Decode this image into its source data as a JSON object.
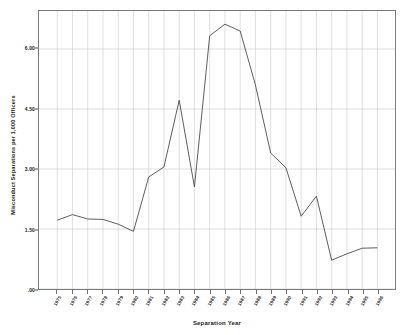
{
  "chart_data": {
    "type": "line",
    "title": "",
    "xlabel": "Separation Year",
    "ylabel": "Misconduct Separations per 1,000 Officers",
    "categories": [
      "1975",
      "1976",
      "1977",
      "1978",
      "1979",
      "1980",
      "1981",
      "1982",
      "1983",
      "1984",
      "1985",
      "1986",
      "1987",
      "1988",
      "1989",
      "1990",
      "1991",
      "1992",
      "1993",
      "1994",
      "1995",
      "1996"
    ],
    "values": [
      1.72,
      1.86,
      1.75,
      1.74,
      1.62,
      1.44,
      2.8,
      3.05,
      4.72,
      2.55,
      6.33,
      6.62,
      6.45,
      5.1,
      3.4,
      3.03,
      1.82,
      2.32,
      0.72,
      0.88,
      1.02,
      1.03
    ],
    "series": [
      {
        "name": "Misconduct Separations per 1,000 Officers",
        "values": [
          1.72,
          1.86,
          1.75,
          1.74,
          1.62,
          1.44,
          2.8,
          3.05,
          4.72,
          2.55,
          6.33,
          6.62,
          6.45,
          5.1,
          3.4,
          3.03,
          1.82,
          2.32,
          0.72,
          0.88,
          1.02,
          1.03
        ]
      }
    ],
    "ylim": [
      0.0,
      6.95
    ],
    "yticks": [
      0.0,
      1.5,
      3.0,
      4.5,
      6.0
    ],
    "ytick_labels": [
      ".00",
      "1.50",
      "3.00",
      "4.50",
      "6.00"
    ],
    "grid": {
      "vertical": true,
      "horizontal": true,
      "color": "#c9c9c9"
    },
    "legend": null,
    "legend_position": "none",
    "line_color": "#4a4a4a",
    "frame_color": "#7a7a7a",
    "background": "#ffffff"
  }
}
